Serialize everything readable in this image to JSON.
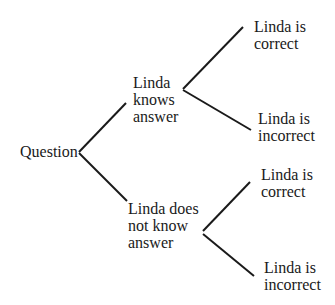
{
  "diagram": {
    "type": "tree",
    "root": {
      "label": "Question"
    },
    "branches": [
      {
        "label": "Linda\nknows\nanswer",
        "outcomes": [
          {
            "label": "Linda is\ncorrect"
          },
          {
            "label": "Linda is\nincorrect"
          }
        ]
      },
      {
        "label": "Linda does\nnot know\nanswer",
        "outcomes": [
          {
            "label": "Linda is\ncorrect"
          },
          {
            "label": "Linda is\nincorrect"
          }
        ]
      }
    ],
    "line_color": "#1a1a1a"
  }
}
